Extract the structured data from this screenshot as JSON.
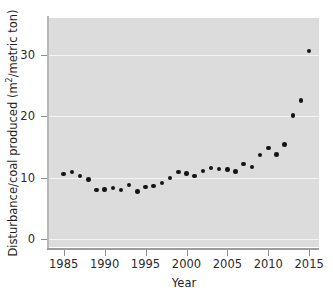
{
  "chart_data": {
    "type": "scatter",
    "title": "",
    "xlabel": "Year",
    "ylabel": "Disturbance/coal produced (m2/metric ton)",
    "ylabel_prefix": "Disturbance/coal produced (m",
    "ylabel_exponent": "2",
    "ylabel_suffix": "/metric ton)",
    "xlim": [
      1983.2,
      2016.2
    ],
    "ylim": [
      -1.3,
      36.0
    ],
    "xticks": [
      1985,
      1990,
      1995,
      2000,
      2005,
      2010,
      2015
    ],
    "xtick_labels": [
      "1985",
      "1990",
      "1995",
      "2000",
      "2005",
      "2010",
      "2015"
    ],
    "yticks": [
      0,
      10,
      20,
      30
    ],
    "ytick_labels": [
      "0",
      "10",
      "20",
      "30"
    ],
    "grid": "horizontal-white-on-gray",
    "legend": "none",
    "panel_color": "#dcdcdc",
    "gridline_color": "#f4f4f4",
    "marker_color": "#151515",
    "x": [
      1985,
      1986,
      1987,
      1988,
      1989,
      1990,
      1991,
      1992,
      1993,
      1994,
      1995,
      1996,
      1997,
      1998,
      1999,
      2000,
      2001,
      2002,
      2003,
      2004,
      2005,
      2006,
      2007,
      2008,
      2009,
      2010,
      2011,
      2012,
      2013,
      2014,
      2015
    ],
    "values": [
      10.6,
      10.9,
      10.3,
      9.7,
      8.0,
      8.1,
      8.3,
      8.0,
      8.8,
      7.7,
      8.5,
      8.6,
      9.1,
      9.9,
      10.9,
      10.7,
      10.3,
      11.1,
      11.6,
      11.4,
      11.3,
      11.0,
      12.2,
      11.7,
      13.7,
      14.8,
      13.8,
      15.4,
      20.1,
      22.6,
      30.6
    ],
    "series": [
      {
        "name": "Disturbance per coal produced",
        "points": [
          {
            "year": 1985,
            "value": 10.6
          },
          {
            "year": 1986,
            "value": 10.9
          },
          {
            "year": 1987,
            "value": 10.3
          },
          {
            "year": 1988,
            "value": 9.7
          },
          {
            "year": 1989,
            "value": 8.0
          },
          {
            "year": 1990,
            "value": 8.1
          },
          {
            "year": 1991,
            "value": 8.3
          },
          {
            "year": 1992,
            "value": 8.0
          },
          {
            "year": 1993,
            "value": 8.8
          },
          {
            "year": 1994,
            "value": 7.7
          },
          {
            "year": 1995,
            "value": 8.5
          },
          {
            "year": 1996,
            "value": 8.6
          },
          {
            "year": 1997,
            "value": 9.1
          },
          {
            "year": 1998,
            "value": 9.9
          },
          {
            "year": 1999,
            "value": 10.9
          },
          {
            "year": 2000,
            "value": 10.7
          },
          {
            "year": 2001,
            "value": 10.3
          },
          {
            "year": 2002,
            "value": 11.1
          },
          {
            "year": 2003,
            "value": 11.6
          },
          {
            "year": 2004,
            "value": 11.4
          },
          {
            "year": 2005,
            "value": 11.3
          },
          {
            "year": 2006,
            "value": 11.0
          },
          {
            "year": 2007,
            "value": 12.2
          },
          {
            "year": 2008,
            "value": 11.7
          },
          {
            "year": 2009,
            "value": 13.7
          },
          {
            "year": 2010,
            "value": 14.8
          },
          {
            "year": 2011,
            "value": 13.8
          },
          {
            "year": 2012,
            "value": 15.4
          },
          {
            "year": 2013,
            "value": 20.1
          },
          {
            "year": 2014,
            "value": 22.6
          },
          {
            "year": 2015,
            "value": 30.6
          }
        ]
      }
    ]
  }
}
